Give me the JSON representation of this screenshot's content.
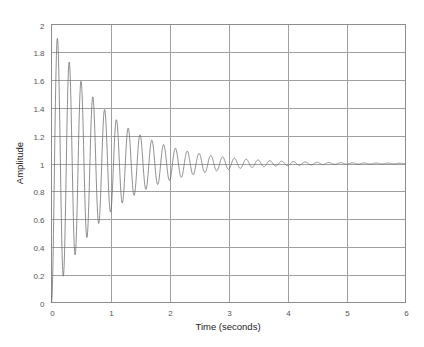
{
  "chart_data": {
    "type": "line",
    "title": "",
    "xlabel": "Time (seconds)",
    "ylabel": "Amplitude",
    "xlim": [
      0,
      6
    ],
    "ylim": [
      0,
      2
    ],
    "xticks": [
      0,
      1,
      2,
      3,
      4,
      5,
      6
    ],
    "xtick_labels": [
      "0",
      "1",
      "2",
      "3",
      "4",
      "5",
      "6"
    ],
    "yticks": [
      0,
      0.2,
      0.4,
      0.6,
      0.8,
      1,
      1.2,
      1.4,
      1.6,
      1.8,
      2
    ],
    "ytick_labels": [
      "0",
      "0.2",
      "0.4",
      "0.6",
      "0.8",
      "1",
      "1.2",
      "1.4",
      "1.6",
      "1.8",
      "2"
    ],
    "grid": true,
    "legend": null,
    "series": [
      {
        "name": "step response",
        "description": "Underdamped second-order step response settling to 1",
        "final_value": 1,
        "peak_value": 1.89,
        "peak_time": 0.1,
        "oscillation_period": 0.2,
        "decay_rate": 1.05,
        "key_points": [
          {
            "x": 0,
            "y": 0
          },
          {
            "x": 0.1,
            "y": 1.89
          },
          {
            "x": 0.2,
            "y": 0.18
          },
          {
            "x": 0.3,
            "y": 1.73
          },
          {
            "x": 0.5,
            "y": 1.59
          },
          {
            "x": 1.0,
            "y": 1.33
          },
          {
            "x": 2.0,
            "y": 1.12
          },
          {
            "x": 3.0,
            "y": 1.045
          },
          {
            "x": 4.0,
            "y": 1.015
          },
          {
            "x": 6.0,
            "y": 1.0
          }
        ]
      }
    ]
  }
}
